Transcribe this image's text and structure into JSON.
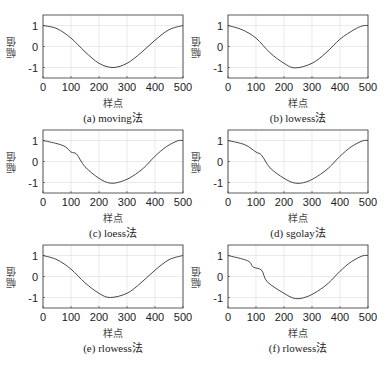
{
  "colors": {
    "line": "#333333",
    "axis": "#333333",
    "grid": "#dcdcdc",
    "background": "#ffffff"
  },
  "panels": [
    {
      "id": "a",
      "caption": "(a)  moving法",
      "ylabel": "幅值",
      "xlabel": "样点"
    },
    {
      "id": "b",
      "caption": "(b)  lowess法",
      "ylabel": "幅值",
      "xlabel": "样点"
    },
    {
      "id": "c",
      "caption": "(c)  loess法",
      "ylabel": "幅值",
      "xlabel": "样点"
    },
    {
      "id": "d",
      "caption": "(d)  sgolay法",
      "ylabel": "幅值",
      "xlabel": "样点"
    },
    {
      "id": "e",
      "caption": "(e)  rlowess法",
      "ylabel": "幅值",
      "xlabel": "样点"
    },
    {
      "id": "f",
      "caption": "(f)  rlowess法",
      "ylabel": "幅值",
      "xlabel": "样点"
    }
  ],
  "chart_data": [
    {
      "type": "line",
      "title": "(a) moving法",
      "xlabel": "样点",
      "ylabel": "幅值",
      "xlim": [
        0,
        500
      ],
      "ylim": [
        -1.5,
        1.5
      ],
      "grid": true,
      "xticks": [
        0,
        100,
        200,
        300,
        400,
        500
      ],
      "yticks": [
        -1,
        0,
        1
      ],
      "x": [
        0,
        50,
        100,
        150,
        200,
        250,
        300,
        350,
        400,
        450,
        500
      ],
      "values": [
        1.0,
        0.85,
        0.4,
        -0.25,
        -0.8,
        -1.0,
        -0.8,
        -0.3,
        0.3,
        0.8,
        1.0
      ]
    },
    {
      "type": "line",
      "title": "(b) lowess法",
      "xlabel": "样点",
      "ylabel": "幅值",
      "xlim": [
        0,
        500
      ],
      "ylim": [
        -1.5,
        1.5
      ],
      "grid": true,
      "xticks": [
        0,
        100,
        200,
        300,
        400,
        500
      ],
      "yticks": [
        -1,
        0,
        1
      ],
      "x": [
        0,
        50,
        100,
        150,
        200,
        240,
        300,
        350,
        400,
        450,
        480,
        500
      ],
      "values": [
        1.0,
        0.8,
        0.4,
        -0.3,
        -0.8,
        -1.02,
        -0.8,
        -0.3,
        0.35,
        0.8,
        0.98,
        1.0
      ]
    },
    {
      "type": "line",
      "title": "(c) loess法",
      "xlabel": "样点",
      "ylabel": "幅值",
      "xlim": [
        0,
        500
      ],
      "ylim": [
        -1.5,
        1.5
      ],
      "grid": true,
      "xticks": [
        0,
        100,
        200,
        300,
        400,
        500
      ],
      "yticks": [
        -1,
        0,
        1
      ],
      "x": [
        0,
        50,
        80,
        100,
        120,
        150,
        200,
        240,
        280,
        320,
        360,
        400,
        440,
        480,
        500
      ],
      "values": [
        1.0,
        0.85,
        0.7,
        0.45,
        0.35,
        -0.25,
        -0.8,
        -1.03,
        -0.95,
        -0.7,
        -0.3,
        0.25,
        0.7,
        0.98,
        1.0
      ]
    },
    {
      "type": "line",
      "title": "(d) sgolay法",
      "xlabel": "样点",
      "ylabel": "幅值",
      "xlim": [
        0,
        500
      ],
      "ylim": [
        -1.5,
        1.5
      ],
      "grid": true,
      "xticks": [
        0,
        100,
        200,
        300,
        400,
        500
      ],
      "yticks": [
        -1,
        0,
        1
      ],
      "x": [
        0,
        60,
        100,
        120,
        150,
        200,
        240,
        280,
        320,
        360,
        400,
        440,
        480,
        500
      ],
      "values": [
        1.0,
        0.8,
        0.45,
        0.3,
        -0.3,
        -0.8,
        -1.03,
        -0.97,
        -0.7,
        -0.3,
        0.25,
        0.7,
        0.98,
        1.0
      ]
    },
    {
      "type": "line",
      "title": "(e) rlowess法",
      "xlabel": "样点",
      "ylabel": "幅值",
      "xlim": [
        0,
        500
      ],
      "ylim": [
        -1.5,
        1.5
      ],
      "grid": true,
      "xticks": [
        0,
        100,
        200,
        300,
        400,
        500
      ],
      "yticks": [
        -1,
        0,
        1
      ],
      "x": [
        0,
        50,
        100,
        150,
        200,
        240,
        300,
        350,
        400,
        450,
        500
      ],
      "values": [
        1.0,
        0.8,
        0.35,
        -0.3,
        -0.8,
        -1.0,
        -0.8,
        -0.3,
        0.3,
        0.8,
        1.0
      ]
    },
    {
      "type": "line",
      "title": "(f) rlowess法",
      "xlabel": "样点",
      "ylabel": "幅值",
      "xlim": [
        0,
        500
      ],
      "ylim": [
        -1.5,
        1.5
      ],
      "grid": true,
      "xticks": [
        0,
        100,
        200,
        300,
        400,
        500
      ],
      "yticks": [
        -1,
        0,
        1
      ],
      "x": [
        0,
        70,
        90,
        120,
        140,
        200,
        240,
        280,
        320,
        360,
        400,
        440,
        480,
        500
      ],
      "values": [
        1.0,
        0.75,
        0.45,
        0.3,
        -0.25,
        -0.8,
        -1.05,
        -0.97,
        -0.7,
        -0.3,
        0.25,
        0.7,
        0.98,
        1.0
      ]
    }
  ]
}
